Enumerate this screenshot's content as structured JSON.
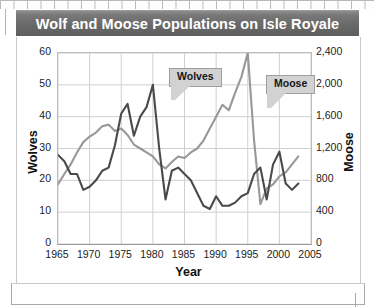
{
  "title": "Wolf and Moose Populations on Isle Royale",
  "axis_titles": {
    "left": "Wolves",
    "right": "Moose",
    "bottom": "Year"
  },
  "callouts": {
    "wolves": "Wolves",
    "moose": "Moose"
  },
  "colors": {
    "title_bar": "#696969",
    "wolves_line": "#4a4a4a",
    "moose_line": "#989898",
    "gridline": "#cfcfcf",
    "axis": "#9a9a9a",
    "callout_fill": "#d2d2d2",
    "text": "#1c1c1c"
  },
  "chart_data": {
    "type": "line",
    "title": "Wolf and Moose Populations on Isle Royale",
    "xlabel": "Year",
    "ylabel": "Wolves",
    "y2label": "Moose",
    "xlim": [
      1965,
      2005
    ],
    "ylim": [
      0,
      60
    ],
    "y2lim": [
      0,
      2400
    ],
    "xticks": [
      1965,
      1970,
      1975,
      1980,
      1985,
      1990,
      1995,
      2000,
      2005
    ],
    "xticklabels": [
      "1965",
      "1970",
      "1975",
      "1980",
      "1985",
      "1990",
      "1995",
      "2000",
      "2005"
    ],
    "yticks": [
      0,
      10,
      20,
      30,
      40,
      50,
      60
    ],
    "yticklabels": [
      "0",
      "10",
      "20",
      "30",
      "40",
      "50",
      "60"
    ],
    "y2ticks": [
      0,
      400,
      800,
      1200,
      1600,
      2000,
      2400
    ],
    "y2ticklabels": [
      "0",
      "400",
      "800",
      "1,200",
      "1,600",
      "2,000",
      "2,400"
    ],
    "grid": true,
    "legend_position": "inline-callouts",
    "series": [
      {
        "name": "Wolves",
        "axis": "left",
        "color": "#4a4a4a",
        "x": [
          1965,
          1966,
          1967,
          1968,
          1969,
          1970,
          1971,
          1972,
          1973,
          1974,
          1975,
          1976,
          1977,
          1978,
          1979,
          1980,
          1981,
          1982,
          1983,
          1984,
          1985,
          1986,
          1987,
          1988,
          1989,
          1990,
          1991,
          1992,
          1993,
          1994,
          1995,
          1996,
          1997,
          1998,
          1999,
          2000,
          2001,
          2002,
          2003
        ],
        "y": [
          28,
          26,
          22,
          22,
          17,
          18,
          20,
          23,
          24,
          31,
          41,
          44,
          34,
          40,
          43,
          50,
          30,
          14,
          23,
          24,
          22,
          20,
          16,
          12,
          11,
          15,
          12,
          12,
          13,
          15,
          16,
          22,
          24,
          14,
          25,
          29,
          19,
          17,
          19
        ]
      },
      {
        "name": "Moose",
        "axis": "right",
        "color": "#989898",
        "x": [
          1965,
          1966,
          1967,
          1968,
          1969,
          1970,
          1971,
          1972,
          1973,
          1974,
          1975,
          1976,
          1977,
          1978,
          1979,
          1980,
          1981,
          1982,
          1983,
          1984,
          1985,
          1986,
          1987,
          1988,
          1989,
          1990,
          1991,
          1992,
          1993,
          1994,
          1995,
          1996,
          1997,
          1998,
          1999,
          2000,
          2001,
          2002,
          2003
        ],
        "y": [
          750,
          880,
          1000,
          1150,
          1280,
          1350,
          1400,
          1480,
          1500,
          1420,
          1450,
          1370,
          1250,
          1200,
          1150,
          1100,
          1000,
          950,
          1030,
          1100,
          1080,
          1150,
          1200,
          1300,
          1450,
          1600,
          1750,
          1680,
          1900,
          2100,
          2400,
          1300,
          500,
          700,
          750,
          850,
          900,
          1000,
          1100
        ]
      }
    ]
  }
}
